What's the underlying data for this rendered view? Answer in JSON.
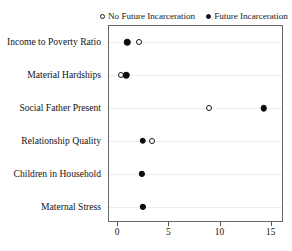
{
  "chart_data": {
    "type": "scatter",
    "title": "",
    "subtitle": "",
    "xlabel": "",
    "ylabel": "",
    "xlim": [
      -0.9,
      16.2
    ],
    "xticks": [
      0,
      5,
      10,
      15
    ],
    "xticklabels": [
      "0",
      "5",
      "10",
      "15"
    ],
    "grid": true,
    "grid_axis": "y",
    "legend_position": "top",
    "orientation": "horizontal",
    "categories": [
      "Income to Poverty Ratio",
      "Material Hardships",
      "Social Father Present",
      "Relationship Quality",
      "Children in Household",
      "Maternal Stress"
    ],
    "series": [
      {
        "name": "No Future Incarceration",
        "marker": "open-circle",
        "color": "#1a1a1a",
        "fill": "#ffffff",
        "values": [
          2.0,
          0.3,
          8.9,
          3.3,
          2.3,
          2.4
        ]
      },
      {
        "name": "Future Incarceration",
        "marker": "filled-circle",
        "color": "#0d0d0d",
        "fill": "#0d0d0d",
        "values": [
          0.9,
          0.8,
          14.2,
          2.4,
          2.3,
          2.4
        ]
      }
    ]
  },
  "legend": {
    "entries": [
      {
        "label": "No Future Incarceration",
        "marker": "open-circle"
      },
      {
        "label": "Future Incarceration",
        "marker": "filled-circle"
      }
    ]
  },
  "axis": {
    "x_tick_labels": [
      "0",
      "5",
      "10",
      "15"
    ]
  }
}
